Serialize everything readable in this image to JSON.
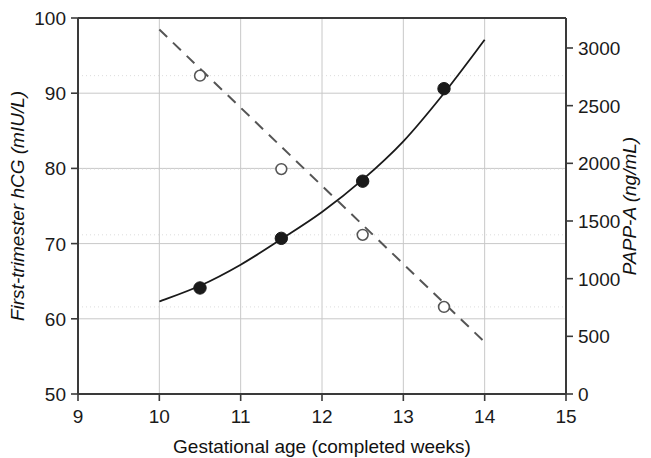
{
  "chart_data": {
    "type": "line",
    "title": "",
    "subtitle": "",
    "xlabel": "Gestational age (completed weeks)",
    "ylabel": "First-trimester hCG (mIU/L)",
    "y2label": "PAPP-A (ng/mL)",
    "xlim": [
      9,
      15
    ],
    "ylim": [
      50,
      100
    ],
    "y2lim": [
      0,
      3260
    ],
    "xticks": [
      "9",
      "10",
      "11",
      "12",
      "13",
      "14",
      "15"
    ],
    "xtick_values": [
      9,
      10,
      11,
      12,
      13,
      14,
      15
    ],
    "yticks": [
      "50",
      "60",
      "70",
      "80",
      "90",
      "100"
    ],
    "ytick_values": [
      50,
      60,
      70,
      80,
      90,
      100
    ],
    "y2ticks": [
      "0",
      "500",
      "1000",
      "1500",
      "2000",
      "2500",
      "3000"
    ],
    "y2tick_values": [
      0,
      500,
      1000,
      1500,
      2000,
      2500,
      3000
    ],
    "grid": true,
    "grid_x_values": [
      10,
      11,
      12,
      13,
      14
    ],
    "grid_y_values": [
      60,
      70,
      80,
      90
    ],
    "legend": "none",
    "series": [
      {
        "name": "First-trimester hCG",
        "axis": "left",
        "style": "solid",
        "marker": "filled-circle",
        "color": "#1a1a1a",
        "x": [
          10.5,
          11.5,
          12.5,
          13.5
        ],
        "values": [
          64.1,
          70.7,
          78.3,
          90.6
        ],
        "curve_x": [
          10.0,
          10.5,
          11.0,
          11.5,
          12.0,
          12.5,
          13.0,
          13.5,
          14.0
        ],
        "curve_values": [
          62.3,
          64.4,
          67.2,
          70.6,
          74.2,
          78.5,
          83.6,
          90.0,
          97.1
        ]
      },
      {
        "name": "PAPP-A",
        "axis": "right",
        "style": "dashed",
        "marker": "open-circle",
        "color": "#555555",
        "x": [
          10.5,
          11.5,
          12.5,
          13.5
        ],
        "values": [
          2760,
          1950,
          1380,
          755
        ],
        "curve_x": [
          10.0,
          14.0
        ],
        "curve_values": [
          3160,
          450
        ]
      }
    ]
  },
  "axes": {
    "x_title": "Gestational age (completed weeks)",
    "y_left_title": "First-trimester hCG (mIU/L)",
    "y_right_title": "PAPP-A (ng/mL)"
  }
}
